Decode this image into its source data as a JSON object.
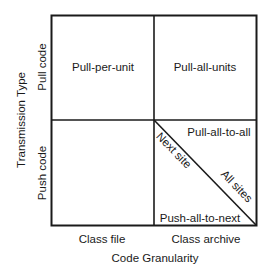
{
  "diagram": {
    "y_axis": {
      "title": "Transmission Type",
      "rows": [
        "Pull code",
        "Push code"
      ]
    },
    "x_axis": {
      "title": "Code Granularity",
      "columns": [
        "Class file",
        "Class archive"
      ]
    },
    "cells": {
      "pull_class_file": "Pull-per-unit",
      "pull_class_archive": "Pull-all-units",
      "push_class_file": "",
      "push_class_archive_upper": "Pull-all-to-all",
      "push_class_archive_lower": "Push-all-to-next"
    },
    "diagonal": {
      "upper_label": "Next site",
      "lower_label": "All sites"
    },
    "colors": {
      "line": "#1a1a1a",
      "background": "#ffffff"
    }
  }
}
